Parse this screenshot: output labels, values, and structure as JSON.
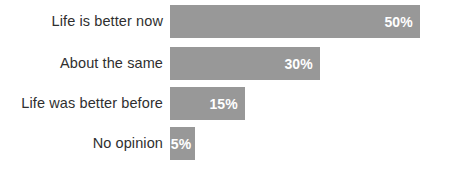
{
  "chart_data": {
    "type": "bar",
    "orientation": "horizontal",
    "title": "",
    "xlabel": "",
    "ylabel": "",
    "categories": [
      "Life is better now",
      "About the same",
      "Life was better before",
      "No opinion"
    ],
    "values": [
      50,
      30,
      15,
      5
    ],
    "value_labels": [
      "50%",
      "30%",
      "15%",
      "5%"
    ],
    "xlim": [
      0,
      50
    ],
    "grid": false,
    "legend": false,
    "bar_color": "#989898",
    "value_label_color": "#ffffff",
    "category_label_color": "#2f2f2f",
    "background_color": "#ffffff",
    "px_per_unit": 5
  }
}
